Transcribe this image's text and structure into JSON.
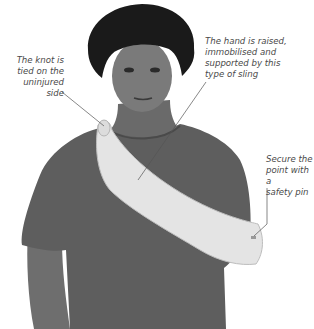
{
  "figure": {
    "colors": {
      "background": "#ffffff",
      "shirt": "#5e5e5e",
      "skin": "#7a7a7a",
      "hair": "#1a1a1a",
      "sling": "#e4e4e4",
      "label_text": "#4a4a4a",
      "leader_line": "#555555"
    }
  },
  "annotations": [
    {
      "id": "knot",
      "lines": [
        "The knot is",
        "tied on the",
        "uninjured side"
      ]
    },
    {
      "id": "hand",
      "lines": [
        "The hand is raised,",
        "immobilised and",
        "supported by this",
        "type of sling"
      ]
    },
    {
      "id": "pin",
      "lines": [
        "Secure the",
        "point with a",
        "safety pin"
      ]
    }
  ]
}
